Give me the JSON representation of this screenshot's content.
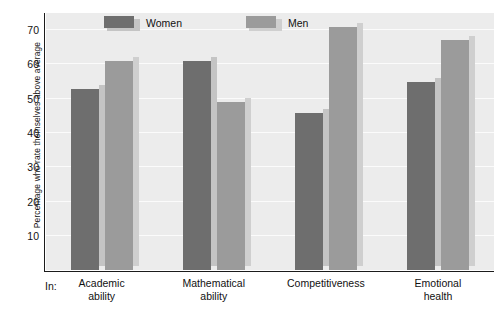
{
  "chart_data": {
    "type": "bar",
    "title": "",
    "subtitle": "",
    "xlabel": "In:",
    "ylabel": "Percentage who rate themselves above average",
    "categories": [
      "Academic ability",
      "Mathematical ability",
      "Competitiveness",
      "Emotional health"
    ],
    "category_lines": [
      [
        "Academic",
        "ability"
      ],
      [
        "Mathematical",
        "ability"
      ],
      [
        "Competitiveness",
        ""
      ],
      [
        "Emotional",
        "health"
      ]
    ],
    "series": [
      {
        "name": "Women",
        "color": "#6e6e6e",
        "values": [
          53,
          61,
          46,
          55
        ]
      },
      {
        "name": "Men",
        "color": "#9b9b9b",
        "values": [
          61,
          49,
          71,
          67
        ]
      }
    ],
    "ylim": [
      0,
      75
    ],
    "yticks": [
      10,
      20,
      30,
      40,
      50,
      60,
      70
    ],
    "ytick_labels": [
      "10",
      "20",
      "30",
      "40",
      "50",
      "60",
      "70"
    ],
    "grid": true,
    "grid_color": "#fbfbfb",
    "legend_position": "top-left-inside",
    "plot_background": "#ececec",
    "axis_color": "#1b1b1b",
    "shadow_color": "#c4c4c4"
  },
  "legend": {
    "items": [
      {
        "label": "Women",
        "swatch": "women-swatch"
      },
      {
        "label": "Men",
        "swatch": "men-swatch"
      }
    ]
  },
  "axis": {
    "y_title": "Percentage who rate themselves above average",
    "x_prefix": "In:",
    "ticks": [
      "70",
      "60",
      "50",
      "40",
      "30",
      "20",
      "10"
    ]
  }
}
